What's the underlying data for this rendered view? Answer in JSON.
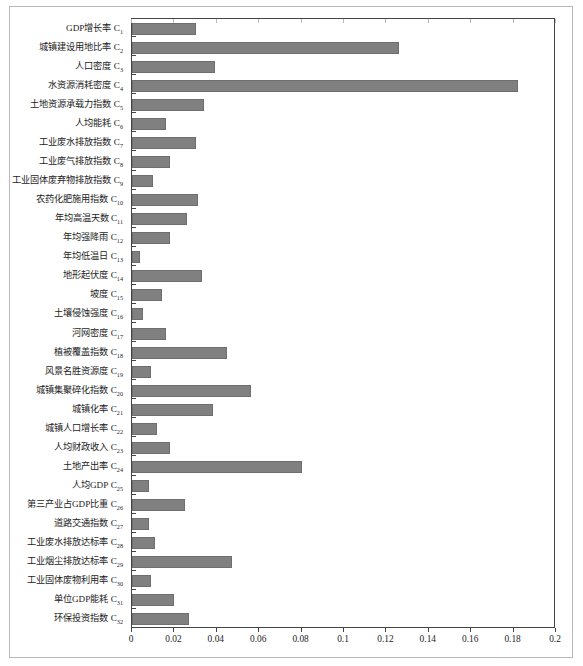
{
  "chart_data": {
    "type": "bar",
    "orientation": "horizontal",
    "title": "",
    "xlabel": "",
    "ylabel": "",
    "xlim": [
      0,
      0.2
    ],
    "xticks": [
      "0",
      "0.02",
      "0.04",
      "0.06",
      "0.08",
      "0.1",
      "0.12",
      "0.14",
      "0.16",
      "0.18",
      "0.2"
    ],
    "grid": false,
    "legend": "none",
    "bar_color": "#808080",
    "categories": [
      "GDP增长率 C₁",
      "城镇建设用地比率 C₂",
      "人口密度 C₃",
      "水资源消耗密度 C₄",
      "土地资源承载力指数 C₅",
      "人均能耗 C₆",
      "工业废水排放指数 C₇",
      "工业废气排放指数 C₈",
      "工业固体废弃物排放指数 C₉",
      "农药化肥施用指数 C₁₀",
      "年均高温天数 C₁₁",
      "年均强降雨 C₁₂",
      "年均低温日 C₁₃",
      "地形起伏度 C₁₄",
      "坡度 C₁₅",
      "土壤侵蚀强度 C₁₆",
      "河网密度 C₁₇",
      "植被覆盖指数 C₁₈",
      "风景名胜资源度 C₁₉",
      "城镇集聚碎化指数 C₂₀",
      "城镇化率 C₂₁",
      "城镇人口增长率 C₂₂",
      "人均财政收入 C₂₃",
      "土地产出率 C₂₄",
      "人均GDP C₂₅",
      "第三产业占GDP比重 C₂₆",
      "道路交通指数 C₂₇",
      "工业废水排放达标率 C₂₈",
      "工业烟尘排放达标率 C₂₉",
      "工业固体废物利用率 C₃₀",
      "单位GDP能耗 C₃₁",
      "环保投资指数 C₃₂"
    ],
    "values": [
      0.03,
      0.126,
      0.039,
      0.182,
      0.034,
      0.016,
      0.03,
      0.018,
      0.01,
      0.031,
      0.026,
      0.018,
      0.004,
      0.033,
      0.014,
      0.005,
      0.016,
      0.045,
      0.009,
      0.056,
      0.038,
      0.012,
      0.018,
      0.08,
      0.008,
      0.025,
      0.008,
      0.011,
      0.047,
      0.009,
      0.02,
      0.027
    ],
    "labels_plain": [
      {
        "name": "GDP增长率",
        "code": "C",
        "sub": "1"
      },
      {
        "name": "城镇建设用地比率",
        "code": "C",
        "sub": "2"
      },
      {
        "name": "人口密度",
        "code": "C",
        "sub": "3"
      },
      {
        "name": "水资源消耗密度",
        "code": "C",
        "sub": "4"
      },
      {
        "name": "土地资源承载力指数",
        "code": "C",
        "sub": "5"
      },
      {
        "name": "人均能耗",
        "code": "C",
        "sub": "6"
      },
      {
        "name": "工业废水排放指数",
        "code": "C",
        "sub": "7"
      },
      {
        "name": "工业废气排放指数",
        "code": "C",
        "sub": "8"
      },
      {
        "name": "工业固体废弃物排放指数",
        "code": "C",
        "sub": "9"
      },
      {
        "name": "农药化肥施用指数",
        "code": "C",
        "sub": "10"
      },
      {
        "name": "年均高温天数",
        "code": "C",
        "sub": "11"
      },
      {
        "name": "年均强降雨",
        "code": "C",
        "sub": "12"
      },
      {
        "name": "年均低温日",
        "code": "C",
        "sub": "13"
      },
      {
        "name": "地形起伏度",
        "code": "C",
        "sub": "14"
      },
      {
        "name": "坡度",
        "code": "C",
        "sub": "15"
      },
      {
        "name": "土壤侵蚀强度",
        "code": "C",
        "sub": "16"
      },
      {
        "name": "河网密度",
        "code": "C",
        "sub": "17"
      },
      {
        "name": "植被覆盖指数",
        "code": "C",
        "sub": "18"
      },
      {
        "name": "风景名胜资源度",
        "code": "C",
        "sub": "19"
      },
      {
        "name": "城镇集聚碎化指数",
        "code": "C",
        "sub": "20"
      },
      {
        "name": "城镇化率",
        "code": "C",
        "sub": "21"
      },
      {
        "name": "城镇人口增长率",
        "code": "C",
        "sub": "22"
      },
      {
        "name": "人均财政收入",
        "code": "C",
        "sub": "23"
      },
      {
        "name": "土地产出率",
        "code": "C",
        "sub": "24"
      },
      {
        "name": "人均GDP",
        "code": "C",
        "sub": "25"
      },
      {
        "name": "第三产业占GDP比重",
        "code": "C",
        "sub": "26"
      },
      {
        "name": "道路交通指数",
        "code": "C",
        "sub": "27"
      },
      {
        "name": "工业废水排放达标率",
        "code": "C",
        "sub": "28"
      },
      {
        "name": "工业烟尘排放达标率",
        "code": "C",
        "sub": "29"
      },
      {
        "name": "工业固体废物利用率",
        "code": "C",
        "sub": "30"
      },
      {
        "name": "单位GDP能耗",
        "code": "C",
        "sub": "31"
      },
      {
        "name": "环保投资指数",
        "code": "C",
        "sub": "32"
      }
    ]
  }
}
